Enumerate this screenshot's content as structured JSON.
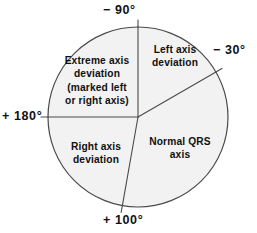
{
  "figure": {
    "geometry": {
      "center_x": 138,
      "center_y": 117,
      "radius": 90,
      "fill_color": "#f2f2f2",
      "stroke_color": "#4a4a4a",
      "background_color": "#ffffff"
    },
    "axis_labels": [
      {
        "id": "minus-90",
        "text": "− 90°",
        "angle_deg": -90,
        "position": "top"
      },
      {
        "id": "minus-30",
        "text": "− 30°",
        "angle_deg": -30,
        "position": "right"
      },
      {
        "id": "plus-180",
        "text": "+ 180°",
        "angle_deg": 180,
        "position": "left"
      },
      {
        "id": "plus-100",
        "text": "+ 100°",
        "angle_deg": 100,
        "position": "bottom"
      }
    ],
    "sectors": [
      {
        "id": "left-axis-deviation",
        "label": "Left axis\ndeviation",
        "start_deg": -90,
        "end_deg": -30
      },
      {
        "id": "normal-qrs-axis",
        "label": "Normal QRS\naxis",
        "start_deg": -30,
        "end_deg": 100
      },
      {
        "id": "right-axis-deviation",
        "label": "Right axis\ndeviation",
        "start_deg": 100,
        "end_deg": 180
      },
      {
        "id": "extreme-axis-deviation",
        "label": "Extreme axis\ndeviation\n(marked left\nor right axis)",
        "start_deg": 180,
        "end_deg": 270
      }
    ]
  },
  "chart_data": {
    "type": "pie",
    "xlabel": "",
    "ylabel": "",
    "grid": false,
    "legend_position": "none",
    "angle_unit": "degrees",
    "angle_convention": "0° at right (3 o'clock), positive clockwise (standard ECG hexaxial reference)",
    "boundaries_deg": [
      -90,
      -30,
      100,
      180
    ],
    "boundary_labels": [
      "− 90°",
      "− 30°",
      "+ 100°",
      "+ 180°"
    ],
    "categories": [
      "Left axis deviation",
      "Normal QRS axis",
      "Right axis deviation",
      "Extreme axis deviation (marked left or right axis)"
    ],
    "values": [
      60,
      130,
      80,
      90
    ],
    "value_units": "degrees of arc",
    "slices": [
      {
        "name": "Left axis deviation",
        "start_deg": -90,
        "end_deg": -30,
        "span_deg": 60,
        "fraction": 0.1667
      },
      {
        "name": "Normal QRS axis",
        "start_deg": -30,
        "end_deg": 100,
        "span_deg": 130,
        "fraction": 0.3611
      },
      {
        "name": "Right axis deviation",
        "start_deg": 100,
        "end_deg": 180,
        "span_deg": 80,
        "fraction": 0.2222
      },
      {
        "name": "Extreme axis deviation (marked left or right axis)",
        "start_deg": 180,
        "end_deg": 270,
        "span_deg": 90,
        "fraction": 0.25
      }
    ]
  }
}
